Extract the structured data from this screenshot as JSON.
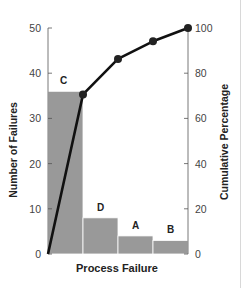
{
  "chart_data": {
    "type": "bar",
    "subtype": "pareto",
    "title": "",
    "xlabel": "Process Failure",
    "ylabel": "Number of Failures",
    "y2label": "Cumulative Percentage",
    "categories": [
      "C",
      "D",
      "A",
      "B"
    ],
    "series": [
      {
        "name": "Number of Failures",
        "type": "bar",
        "axis": "left",
        "values": [
          36,
          8,
          4,
          3
        ],
        "color": "#999999"
      },
      {
        "name": "Cumulative Percentage",
        "type": "line",
        "axis": "right",
        "values": [
          70.6,
          86.3,
          94.1,
          100
        ],
        "color": "#111111",
        "starts_at_origin": true
      }
    ],
    "ylim": [
      0,
      50
    ],
    "y2lim": [
      0,
      100
    ],
    "yticks": [
      0,
      10,
      20,
      30,
      40,
      50
    ],
    "y2ticks": [
      0,
      20,
      40,
      60,
      80,
      100
    ],
    "grid": false,
    "legend": "none"
  }
}
